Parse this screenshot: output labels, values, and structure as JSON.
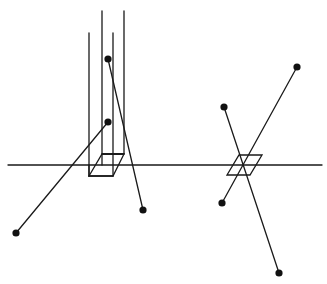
{
  "diagram": {
    "stroke_color": "#1a1a1a",
    "dot_color": "#111111",
    "background": "#ffffff",
    "axis": {
      "x1": 8,
      "y1": 165,
      "x2": 322,
      "y2": 165
    },
    "left_figure": {
      "vertical_lines": [
        {
          "x": 89,
          "y1": 33,
          "y2": 176
        },
        {
          "x": 102,
          "y1": 11,
          "y2": 165
        },
        {
          "x": 113,
          "y1": 33,
          "y2": 154
        },
        {
          "x": 124,
          "y1": 11,
          "y2": 154
        }
      ],
      "box": {
        "front": [
          [
            89,
            176
          ],
          [
            113,
            176
          ],
          [
            124,
            154
          ],
          [
            102,
            154
          ]
        ],
        "edges": [
          [
            [
              89,
              176
            ],
            [
              102,
              154
            ]
          ],
          [
            [
              113,
              176
            ],
            [
              124,
              154
            ]
          ]
        ]
      },
      "segments": [
        {
          "from": [
            108,
            59
          ],
          "to": [
            143,
            210
          ]
        },
        {
          "from": [
            108,
            122
          ],
          "to": [
            16,
            233
          ]
        }
      ],
      "dots": [
        [
          108,
          59
        ],
        [
          108,
          122
        ],
        [
          16,
          233
        ],
        [
          143,
          210
        ]
      ]
    },
    "right_figure": {
      "parallelogram": [
        [
          227,
          175
        ],
        [
          250,
          175
        ],
        [
          262,
          155
        ],
        [
          239,
          155
        ]
      ],
      "segments": [
        {
          "from": [
            297,
            67
          ],
          "to": [
            222,
            203
          ]
        },
        {
          "from": [
            224,
            107
          ],
          "to": [
            279,
            273
          ]
        }
      ],
      "dots": [
        [
          297,
          67
        ],
        [
          224,
          107
        ],
        [
          222,
          203
        ],
        [
          279,
          273
        ]
      ]
    }
  }
}
